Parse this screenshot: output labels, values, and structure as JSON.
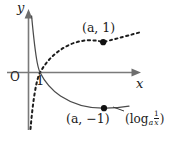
{
  "figure": {
    "axes": {
      "x_axis_label": "x",
      "y_axis_label": "y",
      "origin_label": "O",
      "x_intercept_tick_label": "1"
    },
    "labels": {
      "point_upper": "(a, 1)",
      "point_lower": "(a, −1)",
      "curve_solid_prefix": "(log",
      "curve_solid_base": "a",
      "curve_solid_numerator": "1",
      "curve_solid_denominator": "x",
      "curve_solid_suffix": ")"
    },
    "curves": [
      {
        "name": "log-a-x",
        "style": "dashed",
        "equation": "y = log_a(x)",
        "color": "#1d1d1d",
        "passes_through": "(a, 1)"
      },
      {
        "name": "log-a-one-over-x",
        "style": "solid",
        "equation": "y = log_a(1/x)",
        "color": "#4a4a4a",
        "passes_through": "(a, −1)"
      }
    ],
    "points": [
      {
        "name": "point-a-1",
        "label": "(a, 1)",
        "on_curve": "log-a-x"
      },
      {
        "name": "point-a-minus-1",
        "label": "(a, −1)",
        "on_curve": "log-a-one-over-x"
      }
    ]
  }
}
